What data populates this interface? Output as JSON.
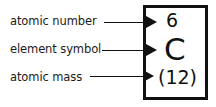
{
  "diagram": {
    "callouts": [
      {
        "label": "atomic number",
        "arrow": "arrow-right",
        "target_value": "6"
      },
      {
        "label": "element  symbol",
        "arrow": "arrow-right",
        "target_value": "C"
      },
      {
        "label": "atomic mass",
        "arrow": "arrow-right",
        "target_value": "(12)"
      }
    ],
    "element_box": {
      "atomic_number": "6",
      "element_symbol": "C",
      "atomic_mass": "(12)",
      "border_color": "#111111",
      "text_color": "#111111",
      "background_color": "#ffffff"
    }
  }
}
